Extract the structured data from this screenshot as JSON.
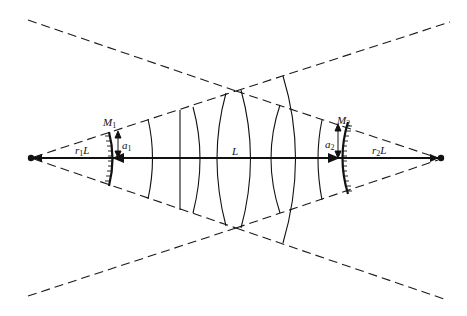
{
  "diagram": {
    "labels": {
      "m1": {
        "base": "M",
        "sub": "1"
      },
      "m2": {
        "base": "M",
        "sub": "2"
      },
      "a1": {
        "base": "a",
        "sub": "1"
      },
      "a2": {
        "base": "a",
        "sub": "2"
      },
      "length": {
        "text": "L"
      },
      "r1l": {
        "base": "r",
        "sub": "1",
        "tail": "L"
      },
      "r2l": {
        "base": "r",
        "sub": "2",
        "tail": "L"
      }
    },
    "colors": {
      "line": "#111111",
      "background": "#ffffff"
    }
  }
}
